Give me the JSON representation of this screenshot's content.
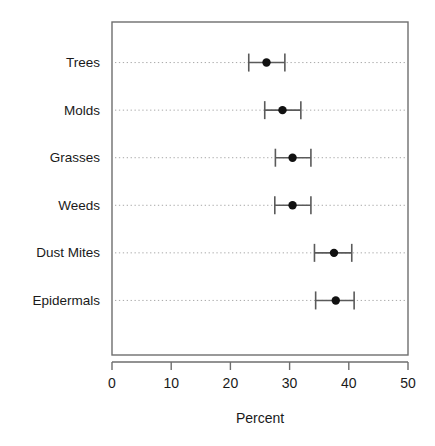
{
  "chart_data": {
    "type": "scatter",
    "title": "",
    "subtitle": "",
    "xlabel": "Percent",
    "ylabel": "",
    "xlim": [
      0,
      50
    ],
    "xticks": [
      0,
      10,
      20,
      30,
      40,
      50
    ],
    "xtick_labels": [
      "0",
      "10",
      "20",
      "30",
      "40",
      "50"
    ],
    "grid": "horizontal-dotted",
    "legend": "none",
    "orientation": "horizontal",
    "error_bars": "confidence-interval",
    "categories": [
      "Trees",
      "Molds",
      "Grasses",
      "Weeds",
      "Dust Mites",
      "Epidermals"
    ],
    "values": [
      26.1,
      28.8,
      30.5,
      30.5,
      37.5,
      37.8
    ],
    "ci_low": [
      23.1,
      25.8,
      27.6,
      27.5,
      34.2,
      34.4
    ],
    "ci_high": [
      29.2,
      31.9,
      33.6,
      33.6,
      40.5,
      40.9
    ],
    "points": [
      {
        "category": "Trees",
        "value": 26.1,
        "ci_low": 23.1,
        "ci_high": 29.2
      },
      {
        "category": "Molds",
        "value": 28.8,
        "ci_low": 25.8,
        "ci_high": 31.9
      },
      {
        "category": "Grasses",
        "value": 30.5,
        "ci_low": 27.6,
        "ci_high": 33.6
      },
      {
        "category": "Weeds",
        "value": 30.5,
        "ci_low": 27.5,
        "ci_high": 33.6
      },
      {
        "category": "Dust Mites",
        "value": 37.5,
        "ci_low": 34.2,
        "ci_high": 40.5
      },
      {
        "category": "Epidermals",
        "value": 37.8,
        "ci_low": 34.4,
        "ci_high": 40.9
      }
    ],
    "colors": {
      "point": "#111111",
      "error_bar": "#5a5a5a",
      "gridline": "#a8a8a8",
      "frame": "#6e6e6e",
      "text": "#1a1a1a",
      "background": "#ffffff"
    }
  }
}
